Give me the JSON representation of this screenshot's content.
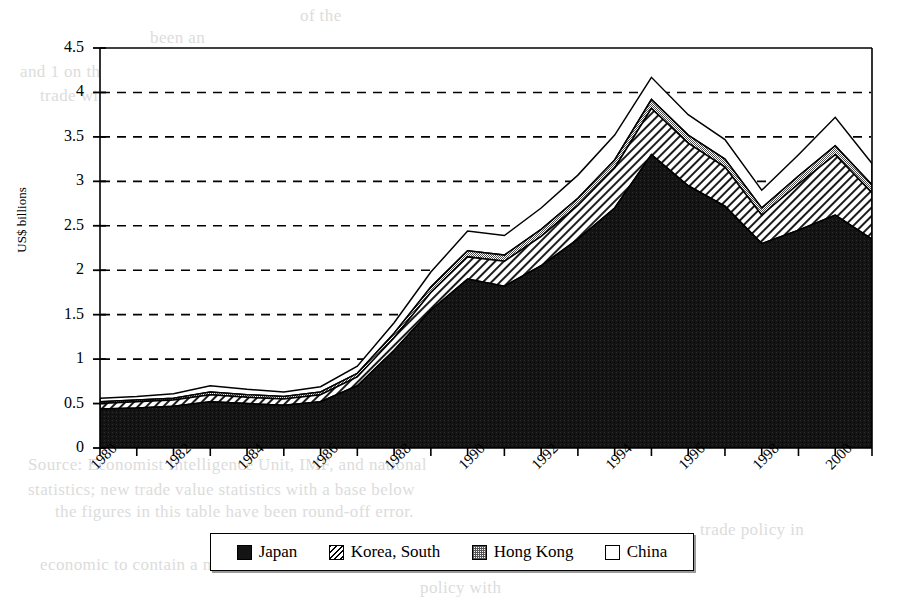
{
  "page": {
    "background_color": "#ffffff",
    "ink_color": "#000000",
    "ghost_text_color": "#dcdcdc"
  },
  "ghost_text": [
    {
      "text": "of the",
      "x": 300,
      "y": 6
    },
    {
      "text": "been an",
      "x": 150,
      "y": 28
    },
    {
      "text": "and 1 on the 1990s was",
      "x": 20,
      "y": 62
    },
    {
      "text": "trade with the United States",
      "x": 40,
      "y": 86
    },
    {
      "text": "to the relation",
      "x": 520,
      "y": 84
    },
    {
      "text": "and the",
      "x": 620,
      "y": 106
    },
    {
      "text": "was of the 1990s",
      "x": 300,
      "y": 60
    },
    {
      "text": "Source: Economist Intelligence Unit, IMF, and national",
      "x": 28,
      "y": 455
    },
    {
      "text": "statistics; new trade value statistics with a base below",
      "x": 28,
      "y": 480
    },
    {
      "text": "the figures in this table have been round-off error.",
      "x": 55,
      "y": 502
    },
    {
      "text": "trade policy in",
      "x": 700,
      "y": 520
    },
    {
      "text": "economic to contain a more secure",
      "x": 40,
      "y": 555
    },
    {
      "text": "policy with",
      "x": 420,
      "y": 578
    }
  ],
  "chart_data": {
    "type": "area",
    "stacked": true,
    "title": "",
    "xlabel": "",
    "ylabel": "US$ billions",
    "ylim": [
      0,
      4.5
    ],
    "ytick_step": 0.5,
    "yticks": [
      "0",
      "0.5",
      "1",
      "1.5",
      "2",
      "2.5",
      "3",
      "3.5",
      "4",
      "4.5"
    ],
    "grid": "horizontal-dashed",
    "legend_position": "bottom",
    "x": [
      1980,
      1981,
      1982,
      1983,
      1984,
      1985,
      1986,
      1987,
      1988,
      1989,
      1990,
      1991,
      1992,
      1993,
      1994,
      1995,
      1996,
      1997,
      1998,
      1999,
      2000,
      2001
    ],
    "xtick_labels": [
      "1980",
      "1982",
      "1984",
      "1986",
      "1988",
      "1990",
      "1992",
      "1994",
      "1996",
      "1998",
      "2000"
    ],
    "xtick_label_years": [
      1980,
      1982,
      1984,
      1986,
      1988,
      1990,
      1992,
      1994,
      1996,
      1998,
      2000
    ],
    "series": [
      {
        "name": "Japan",
        "pattern": "solid-black",
        "color": "#141414",
        "values": [
          0.44,
          0.45,
          0.47,
          0.52,
          0.5,
          0.48,
          0.52,
          0.7,
          1.1,
          1.55,
          1.9,
          1.82,
          2.05,
          2.35,
          2.7,
          3.3,
          2.95,
          2.72,
          2.3,
          2.45,
          2.62,
          2.35
        ]
      },
      {
        "name": "Korea, South",
        "pattern": "diagonal-hatch",
        "color": "#ffffff",
        "values": [
          0.06,
          0.07,
          0.07,
          0.08,
          0.07,
          0.07,
          0.08,
          0.1,
          0.14,
          0.2,
          0.25,
          0.28,
          0.33,
          0.38,
          0.45,
          0.52,
          0.48,
          0.44,
          0.32,
          0.52,
          0.68,
          0.52
        ]
      },
      {
        "name": "Hong Kong",
        "pattern": "fine-checker",
        "color": "#cfcfcf",
        "values": [
          0.02,
          0.02,
          0.02,
          0.03,
          0.03,
          0.03,
          0.03,
          0.04,
          0.05,
          0.06,
          0.07,
          0.07,
          0.08,
          0.08,
          0.09,
          0.1,
          0.09,
          0.09,
          0.08,
          0.09,
          0.1,
          0.09
        ]
      },
      {
        "name": "China",
        "pattern": "white-empty",
        "color": "#ffffff",
        "values": [
          0.04,
          0.04,
          0.05,
          0.07,
          0.06,
          0.05,
          0.06,
          0.08,
          0.12,
          0.17,
          0.22,
          0.22,
          0.24,
          0.26,
          0.28,
          0.25,
          0.23,
          0.22,
          0.2,
          0.24,
          0.32,
          0.24
        ]
      }
    ],
    "totals": [
      0.56,
      0.58,
      0.61,
      0.7,
      0.66,
      0.63,
      0.69,
      0.92,
      1.41,
      1.98,
      2.44,
      2.39,
      2.7,
      3.07,
      3.52,
      4.17,
      3.75,
      3.47,
      2.9,
      3.3,
      3.72,
      3.2
    ]
  },
  "legend": {
    "items": [
      {
        "label": "Japan",
        "swatch": "solid-black-swatch"
      },
      {
        "label": "Korea, South",
        "swatch": "diagonal-hatch-swatch"
      },
      {
        "label": "Hong Kong",
        "swatch": "checker-swatch"
      },
      {
        "label": "China",
        "swatch": "white-swatch"
      }
    ]
  }
}
